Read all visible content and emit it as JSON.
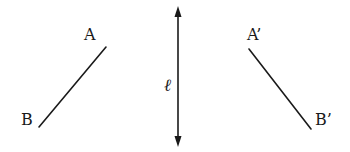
{
  "diagram": {
    "type": "reflection",
    "axis": {
      "label": "ℓ",
      "x": 178,
      "y1": 8,
      "y2": 145,
      "arrows": "both"
    },
    "original_segment": {
      "start_label": "A",
      "end_label": "B",
      "start": [
        106,
        47
      ],
      "end": [
        39,
        127
      ]
    },
    "reflected_segment": {
      "start_label": "A’",
      "end_label": "B’",
      "start": [
        249,
        49
      ],
      "end": [
        311,
        129
      ]
    },
    "colors": {
      "stroke": "#1a1a1a",
      "background": "#ffffff"
    }
  }
}
